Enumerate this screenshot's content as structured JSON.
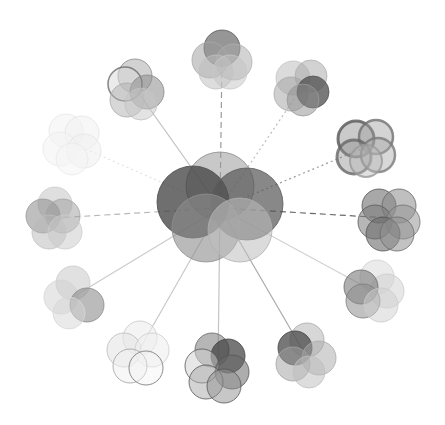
{
  "canvas": {
    "width": 445,
    "height": 425,
    "background": "#ffffff"
  },
  "center": {
    "name": "central-venn-cluster",
    "cx": 220,
    "cy": 208,
    "circles": [
      {
        "dx": 0,
        "dy": -22,
        "r": 34,
        "fill": "#9a9a9a",
        "opacity": 0.55,
        "stroke": "#8a8a8a"
      },
      {
        "dx": -27,
        "dy": -6,
        "r": 36,
        "fill": "#3f3f3f",
        "opacity": 0.75,
        "stroke": "#4a4a4a"
      },
      {
        "dx": 27,
        "dy": -4,
        "r": 36,
        "fill": "#555555",
        "opacity": 0.7,
        "stroke": "#5a5a5a"
      },
      {
        "dx": -14,
        "dy": 20,
        "r": 34,
        "fill": "#8c8c8c",
        "opacity": 0.6,
        "stroke": "#909090"
      },
      {
        "dx": 20,
        "dy": 22,
        "r": 32,
        "fill": "#bdbdbd",
        "opacity": 0.55,
        "stroke": "#b0b0b0"
      }
    ]
  },
  "satellites": [
    {
      "name": "satellite-top",
      "cx": 222,
      "cy": 58,
      "line": "dashed",
      "line_color": "#9a9a9a",
      "circles": [
        {
          "dx": 0,
          "dy": -10,
          "r": 18,
          "fill": "#6a6a6a",
          "opacity": 0.7,
          "stroke": "#5a5a5a"
        },
        {
          "dx": -12,
          "dy": 2,
          "r": 18,
          "fill": "#9a9a9a",
          "opacity": 0.5,
          "stroke": "#aaaaaa"
        },
        {
          "dx": 12,
          "dy": 4,
          "r": 18,
          "fill": "#a8a8a8",
          "opacity": 0.5,
          "stroke": "#b0b0b0"
        },
        {
          "dx": -6,
          "dy": 14,
          "r": 17,
          "fill": "#bcbcbc",
          "opacity": 0.5,
          "stroke": "#c0c0c0"
        },
        {
          "dx": 8,
          "dy": 14,
          "r": 17,
          "fill": "#c4c4c4",
          "opacity": 0.5,
          "stroke": "#c8c8c8"
        }
      ]
    },
    {
      "name": "satellite-top-right",
      "cx": 303,
      "cy": 86,
      "line": "dotted",
      "line_color": "#bdbdbd",
      "circles": [
        {
          "dx": -10,
          "dy": -8,
          "r": 17,
          "fill": "#b8b8b8",
          "opacity": 0.5,
          "stroke": "#c4c4c4"
        },
        {
          "dx": 8,
          "dy": -10,
          "r": 16,
          "fill": "#a6a6a6",
          "opacity": 0.5,
          "stroke": "#b0b0b0"
        },
        {
          "dx": -12,
          "dy": 8,
          "r": 17,
          "fill": "#a0a0a0",
          "opacity": 0.5,
          "stroke": "#aaaaaa"
        },
        {
          "dx": 10,
          "dy": 6,
          "r": 16,
          "fill": "#4c4c4c",
          "opacity": 0.75,
          "stroke": "#555555"
        },
        {
          "dx": 0,
          "dy": 14,
          "r": 16,
          "fill": "#8e8e8e",
          "opacity": 0.5,
          "stroke": "#9a9a9a"
        }
      ]
    },
    {
      "name": "satellite-right-upper",
      "cx": 366,
      "cy": 147,
      "line": "dotted",
      "line_color": "#9a9a9a",
      "circles": [
        {
          "dx": -10,
          "dy": -8,
          "r": 18,
          "fill": "#8a8a8a",
          "opacity": 0.45,
          "stroke": "#555555",
          "sw": 3
        },
        {
          "dx": 10,
          "dy": -10,
          "r": 17,
          "fill": "#a0a0a0",
          "opacity": 0.45,
          "stroke": "#707070",
          "sw": 2.5
        },
        {
          "dx": -12,
          "dy": 10,
          "r": 17,
          "fill": "#909090",
          "opacity": 0.45,
          "stroke": "#666666",
          "sw": 3
        },
        {
          "dx": 12,
          "dy": 8,
          "r": 17,
          "fill": "#a8a8a8",
          "opacity": 0.45,
          "stroke": "#7a7a7a",
          "sw": 2.5
        },
        {
          "dx": 0,
          "dy": 14,
          "r": 16,
          "fill": "#bbbbbb",
          "opacity": 0.45,
          "stroke": "#9a9a9a",
          "sw": 2
        }
      ]
    },
    {
      "name": "satellite-right",
      "cx": 389,
      "cy": 218,
      "line": "dashed",
      "line_color": "#6a6a6a",
      "circles": [
        {
          "dx": -10,
          "dy": -12,
          "r": 17,
          "fill": "#6e6e6e",
          "opacity": 0.6,
          "stroke": "#555555"
        },
        {
          "dx": 10,
          "dy": -12,
          "r": 17,
          "fill": "#8a8a8a",
          "opacity": 0.55,
          "stroke": "#666666"
        },
        {
          "dx": -14,
          "dy": 4,
          "r": 17,
          "fill": "#7a7a7a",
          "opacity": 0.55,
          "stroke": "#5a5a5a"
        },
        {
          "dx": 14,
          "dy": 4,
          "r": 17,
          "fill": "#959595",
          "opacity": 0.55,
          "stroke": "#707070"
        },
        {
          "dx": -6,
          "dy": 16,
          "r": 17,
          "fill": "#6a6a6a",
          "opacity": 0.6,
          "stroke": "#555555"
        },
        {
          "dx": 8,
          "dy": 16,
          "r": 17,
          "fill": "#8f8f8f",
          "opacity": 0.55,
          "stroke": "#6a6a6a"
        }
      ]
    },
    {
      "name": "satellite-right-lower",
      "cx": 373,
      "cy": 291,
      "line": "solid",
      "line_color": "#d2d2d2",
      "circles": [
        {
          "dx": 4,
          "dy": -14,
          "r": 17,
          "fill": "#d8d8d8",
          "opacity": 0.5,
          "stroke": "#cfcfcf"
        },
        {
          "dx": 14,
          "dy": 0,
          "r": 17,
          "fill": "#d0d0d0",
          "opacity": 0.5,
          "stroke": "#cccccc"
        },
        {
          "dx": -12,
          "dy": -4,
          "r": 17,
          "fill": "#7a7a7a",
          "opacity": 0.6,
          "stroke": "#6a6a6a"
        },
        {
          "dx": -10,
          "dy": 10,
          "r": 17,
          "fill": "#8e8e8e",
          "opacity": 0.55,
          "stroke": "#7a7a7a"
        },
        {
          "dx": 8,
          "dy": 14,
          "r": 17,
          "fill": "#cfcfcf",
          "opacity": 0.5,
          "stroke": "#cacaca"
        }
      ]
    },
    {
      "name": "satellite-bottom-right",
      "cx": 305,
      "cy": 354,
      "line": "solid",
      "line_color": "#aaaaaa",
      "circles": [
        {
          "dx": 2,
          "dy": -14,
          "r": 17,
          "fill": "#b0b0b0",
          "opacity": 0.5,
          "stroke": "#aaaaaa"
        },
        {
          "dx": -10,
          "dy": -6,
          "r": 17,
          "fill": "#4a4a4a",
          "opacity": 0.75,
          "stroke": "#444444"
        },
        {
          "dx": 14,
          "dy": 4,
          "r": 17,
          "fill": "#a8a8a8",
          "opacity": 0.5,
          "stroke": "#aaaaaa"
        },
        {
          "dx": -12,
          "dy": 10,
          "r": 17,
          "fill": "#9e9e9e",
          "opacity": 0.5,
          "stroke": "#a4a4a4"
        },
        {
          "dx": 4,
          "dy": 18,
          "r": 16,
          "fill": "#bcbcbc",
          "opacity": 0.5,
          "stroke": "#c0c0c0"
        }
      ]
    },
    {
      "name": "satellite-bottom",
      "cx": 218,
      "cy": 366,
      "line": "solid",
      "line_color": "#c4c4c4",
      "circles": [
        {
          "dx": -6,
          "dy": -16,
          "r": 17,
          "fill": "#7a7a7a",
          "opacity": 0.55,
          "stroke": "#666666"
        },
        {
          "dx": 10,
          "dy": -10,
          "r": 17,
          "fill": "#3c3c3c",
          "opacity": 0.7,
          "stroke": "#444444"
        },
        {
          "dx": -16,
          "dy": 0,
          "r": 17,
          "fill": "#cfcfcf",
          "opacity": 0.5,
          "stroke": "#555555"
        },
        {
          "dx": 14,
          "dy": 6,
          "r": 17,
          "fill": "#6a6a6a",
          "opacity": 0.55,
          "stroke": "#555555"
        },
        {
          "dx": -12,
          "dy": 16,
          "r": 17,
          "fill": "#a8a8a8",
          "opacity": 0.5,
          "stroke": "#555555"
        },
        {
          "dx": 6,
          "dy": 20,
          "r": 17,
          "fill": "#909090",
          "opacity": 0.5,
          "stroke": "#555555"
        }
      ]
    },
    {
      "name": "satellite-bottom-left",
      "cx": 138,
      "cy": 352,
      "line": "solid",
      "line_color": "#c8c8c8",
      "circles": [
        {
          "dx": 2,
          "dy": -14,
          "r": 17,
          "fill": "#ededed",
          "opacity": 0.6,
          "stroke": "#c8c8c8"
        },
        {
          "dx": -14,
          "dy": -2,
          "r": 17,
          "fill": "#e4e4e4",
          "opacity": 0.6,
          "stroke": "#bbbbbb"
        },
        {
          "dx": 14,
          "dy": -2,
          "r": 17,
          "fill": "#eeeeee",
          "opacity": 0.6,
          "stroke": "#cccccc"
        },
        {
          "dx": -8,
          "dy": 14,
          "r": 17,
          "fill": "#f0f0f0",
          "opacity": 0.5,
          "stroke": "#a0a0a0"
        },
        {
          "dx": 8,
          "dy": 16,
          "r": 17,
          "fill": "#f2f2f2",
          "opacity": 0.4,
          "stroke": "#707070"
        }
      ]
    },
    {
      "name": "satellite-left-lower",
      "cx": 73,
      "cy": 297,
      "line": "solid",
      "line_color": "#cccccc",
      "circles": [
        {
          "dx": 0,
          "dy": -14,
          "r": 17,
          "fill": "#c4c4c4",
          "opacity": 0.5,
          "stroke": "#cccccc"
        },
        {
          "dx": -12,
          "dy": 0,
          "r": 17,
          "fill": "#d0d0d0",
          "opacity": 0.5,
          "stroke": "#d4d4d4"
        },
        {
          "dx": 14,
          "dy": 8,
          "r": 17,
          "fill": "#8e8e8e",
          "opacity": 0.6,
          "stroke": "#8a8a8a"
        },
        {
          "dx": -4,
          "dy": 16,
          "r": 16,
          "fill": "#d6d6d6",
          "opacity": 0.5,
          "stroke": "#d8d8d8"
        }
      ]
    },
    {
      "name": "satellite-left",
      "cx": 55,
      "cy": 218,
      "line": "dashed",
      "line_color": "#b8b8b8",
      "circles": [
        {
          "dx": 0,
          "dy": -14,
          "r": 17,
          "fill": "#c0c0c0",
          "opacity": 0.5,
          "stroke": "#cccccc"
        },
        {
          "dx": -12,
          "dy": -2,
          "r": 17,
          "fill": "#8a8a8a",
          "opacity": 0.55,
          "stroke": "#999999"
        },
        {
          "dx": 8,
          "dy": -2,
          "r": 17,
          "fill": "#9c9c9c",
          "opacity": 0.5,
          "stroke": "#a4a4a4"
        },
        {
          "dx": -6,
          "dy": 14,
          "r": 17,
          "fill": "#b8b8b8",
          "opacity": 0.5,
          "stroke": "#c0c0c0"
        },
        {
          "dx": 10,
          "dy": 14,
          "r": 17,
          "fill": "#c8c8c8",
          "opacity": 0.5,
          "stroke": "#cccccc"
        }
      ]
    },
    {
      "name": "satellite-left-upper",
      "cx": 72,
      "cy": 143,
      "line": "dotted",
      "line_color": "#e2e2e2",
      "circles": [
        {
          "dx": -6,
          "dy": -12,
          "r": 17,
          "fill": "#f4f4f4",
          "opacity": 0.6,
          "stroke": "#e6e6e6"
        },
        {
          "dx": 10,
          "dy": -10,
          "r": 17,
          "fill": "#f2f2f2",
          "opacity": 0.6,
          "stroke": "#e4e4e4"
        },
        {
          "dx": -12,
          "dy": 6,
          "r": 17,
          "fill": "#f3f3f3",
          "opacity": 0.6,
          "stroke": "#e8e8e8"
        },
        {
          "dx": 12,
          "dy": 8,
          "r": 17,
          "fill": "#f0f0f0",
          "opacity": 0.6,
          "stroke": "#e4e4e4"
        },
        {
          "dx": 0,
          "dy": 16,
          "r": 16,
          "fill": "#f5f5f5",
          "opacity": 0.6,
          "stroke": "#e8e8e8"
        }
      ]
    },
    {
      "name": "satellite-top-left",
      "cx": 135,
      "cy": 88,
      "line": "solid",
      "line_color": "#c0c0c0",
      "circles": [
        {
          "dx": 0,
          "dy": -12,
          "r": 17,
          "fill": "#a6a6a6",
          "opacity": 0.5,
          "stroke": "#8a8a8a"
        },
        {
          "dx": -10,
          "dy": -4,
          "r": 17,
          "fill": "#d8d8d8",
          "opacity": 0.5,
          "stroke": "#6a6a6a",
          "sw": 1.5
        },
        {
          "dx": 12,
          "dy": 4,
          "r": 17,
          "fill": "#8a8a8a",
          "opacity": 0.55,
          "stroke": "#888888"
        },
        {
          "dx": -8,
          "dy": 12,
          "r": 17,
          "fill": "#b0b0b0",
          "opacity": 0.5,
          "stroke": "#aaaaaa"
        },
        {
          "dx": 6,
          "dy": 16,
          "r": 16,
          "fill": "#c8c8c8",
          "opacity": 0.5,
          "stroke": "#c0c0c0"
        }
      ]
    }
  ]
}
